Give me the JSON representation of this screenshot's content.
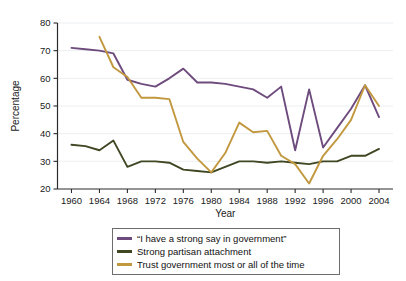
{
  "chart_data": {
    "type": "line",
    "title": "",
    "xlabel": "Year",
    "ylabel": "Percentage",
    "xlim": [
      1958,
      2006
    ],
    "ylim": [
      20,
      80
    ],
    "grid": "horizontal",
    "legend_position": "bottom-center",
    "xticks": [
      1960,
      1964,
      1968,
      1972,
      1976,
      1980,
      1984,
      1988,
      1992,
      1996,
      2000,
      2004
    ],
    "yticks": [
      20,
      30,
      40,
      50,
      60,
      70,
      80
    ],
    "x": [
      1960,
      1962,
      1964,
      1966,
      1968,
      1970,
      1972,
      1974,
      1976,
      1978,
      1980,
      1982,
      1984,
      1986,
      1988,
      1990,
      1992,
      1994,
      1996,
      1998,
      2000,
      2002,
      2004
    ],
    "series": [
      {
        "name": "“I have a strong say in government”",
        "color": "#6e4b7d",
        "values": [
          71,
          70.5,
          70,
          69,
          59.5,
          58,
          57,
          60,
          63.5,
          58.5,
          58.5,
          58,
          57,
          56,
          53,
          57,
          34,
          56,
          35,
          42,
          49,
          57.5,
          46
        ]
      },
      {
        "name": "Strong partisan attachment",
        "color": "#3f4722",
        "values": [
          36,
          35.5,
          34,
          37.5,
          28,
          30,
          30,
          29.5,
          27,
          26.5,
          26,
          28,
          30,
          30,
          29.5,
          30,
          29.5,
          29,
          30,
          30,
          32,
          32,
          34.5
        ]
      },
      {
        "name": "Trust government most or all of the time",
        "color": "#c2983f",
        "values": [
          null,
          null,
          75,
          64,
          60.5,
          53,
          53,
          52.5,
          37,
          31,
          26,
          33,
          44,
          40.5,
          41,
          32,
          29,
          22,
          32,
          38,
          45,
          57.5,
          50
        ]
      }
    ]
  },
  "legend": {
    "items": [
      {
        "label": "“I have a strong say in government”",
        "color": "#6e4b7d"
      },
      {
        "label": "Strong partisan attachment",
        "color": "#3f4722"
      },
      {
        "label": "Trust government most or all of the time",
        "color": "#c2983f"
      }
    ]
  }
}
